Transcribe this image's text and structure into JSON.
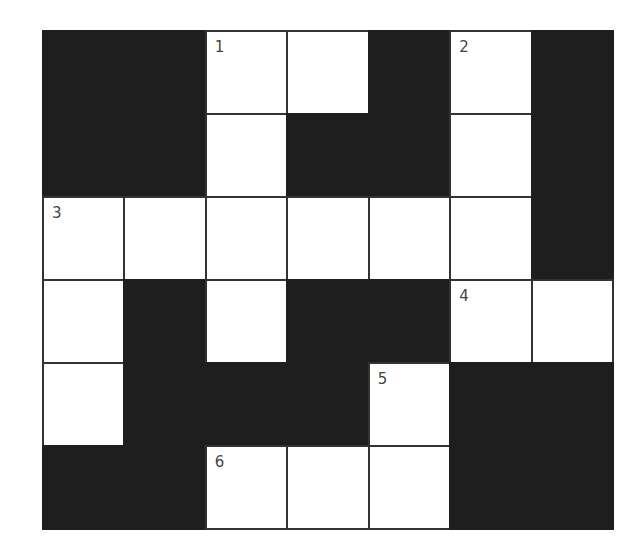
{
  "puzzle": {
    "type": "crossword",
    "rows": 6,
    "cols": 7,
    "layout": [
      "##..#.#",
      "##.##.#",
      "......#",
      ".#.##..",
      ".###.##",
      "##...##"
    ],
    "numbers": [
      {
        "row": 0,
        "col": 2,
        "label": "1"
      },
      {
        "row": 0,
        "col": 5,
        "label": "2"
      },
      {
        "row": 2,
        "col": 0,
        "label": "3"
      },
      {
        "row": 3,
        "col": 5,
        "label": "4"
      },
      {
        "row": 4,
        "col": 4,
        "label": "5"
      },
      {
        "row": 5,
        "col": 2,
        "label": "6"
      }
    ]
  },
  "colors": {
    "block": "#1e1e1e",
    "cell": "#ffffff",
    "line": "#333333"
  }
}
